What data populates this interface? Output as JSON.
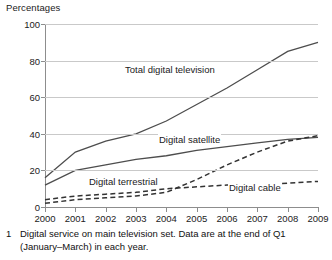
{
  "chart": {
    "axis_title": "Percentages",
    "ylabel": "Percentages",
    "xlabel": ""
  },
  "footnote": {
    "number": "1",
    "text": "Digital service on main television set. Data are at the end of Q1 (January–March) in each year."
  },
  "labels": {
    "total": "Total digital television",
    "satellite": "Digital satellite",
    "terrestrial": "Digital terrestrial",
    "cable": "Digital cable"
  },
  "chart_data": {
    "type": "line",
    "title": "",
    "subtitle": "",
    "xlabel": "",
    "ylabel": "Percentages",
    "ylim": [
      0,
      100
    ],
    "xlim": [
      "2000",
      "2009"
    ],
    "grid": true,
    "legend": "inline-annotations",
    "yticks": [
      0,
      20,
      40,
      60,
      80,
      100
    ],
    "categories": [
      "2000",
      "2001",
      "2002",
      "2003",
      "2004",
      "2005",
      "2006",
      "2007",
      "2008",
      "2009"
    ],
    "series": [
      {
        "name": "Total digital television",
        "style": "solid",
        "values": [
          16,
          30,
          36,
          40,
          47,
          56,
          65,
          75,
          85,
          90
        ]
      },
      {
        "name": "Digital satellite",
        "style": "solid",
        "values": [
          12,
          20,
          23,
          26,
          28,
          31,
          33,
          35,
          37,
          38
        ]
      },
      {
        "name": "Digital terrestrial",
        "style": "dashed",
        "values": [
          2,
          4,
          5,
          6,
          8,
          15,
          23,
          30,
          36,
          39
        ]
      },
      {
        "name": "Digital cable",
        "style": "dashed",
        "values": [
          4,
          6,
          7,
          8,
          10,
          11,
          12,
          12,
          13,
          14
        ]
      }
    ]
  }
}
